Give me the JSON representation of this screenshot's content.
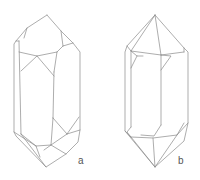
{
  "figure": {
    "type": "crystal-line-drawings",
    "panels": [
      {
        "id": "a",
        "label": "a",
        "description": "Elongated crystal with irregular terminations and rhombic side faces"
      },
      {
        "id": "b",
        "label": "b",
        "description": "Doubly terminated prismatic crystal with pyramidal ends"
      }
    ]
  },
  "colors": {
    "line": "#8a8a8a",
    "label": "#555555",
    "background": "#ffffff"
  }
}
